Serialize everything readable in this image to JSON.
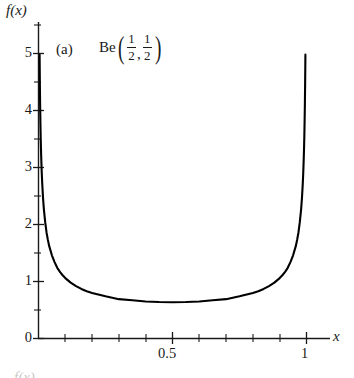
{
  "figure": {
    "panel_label": "(a)",
    "distribution_name": "Be",
    "param1_num": "1",
    "param1_den": "2",
    "param2_num": "1",
    "param2_den": "2",
    "comma": ",",
    "paren_open": "(",
    "paren_close": ")",
    "y_axis_label": "f(x)",
    "x_axis_label": "x",
    "footer_partial": "f(x)"
  },
  "chart_data": {
    "type": "line",
    "xlabel": "x",
    "ylabel": "f(x)",
    "xlim": [
      0,
      1.12
    ],
    "ylim": [
      0,
      5.4
    ],
    "grid": false,
    "legend": null,
    "annotations": [
      {
        "text": "(a)",
        "x": 0.065,
        "y": 5.2
      },
      {
        "text": "Be(1/2, 1/2)",
        "x": 0.28,
        "y": 5.25
      }
    ],
    "x_ticks_major": [
      0.5,
      1
    ],
    "x_tick_labels": [
      "0.5",
      "1"
    ],
    "x_ticks_minor": [
      0.1,
      0.2,
      0.3,
      0.4,
      0.6,
      0.7,
      0.8,
      0.9,
      1.1
    ],
    "y_ticks_major": [
      0,
      1,
      2,
      3,
      4,
      5
    ],
    "y_tick_labels": [
      "0",
      "1",
      "2",
      "3",
      "4",
      "5"
    ],
    "y_ticks_minor": [
      0.5,
      1.5,
      2.5,
      3.5,
      4.5
    ],
    "series": [
      {
        "name": "Be(1/2, 1/2) density",
        "formula": "f(x) = 1 / (pi * sqrt(x * (1 - x)))",
        "color": "#000000",
        "x": [
          0.0041,
          0.0045,
          0.005,
          0.006,
          0.007,
          0.008,
          0.009,
          0.01,
          0.012,
          0.014,
          0.017,
          0.02,
          0.025,
          0.03,
          0.035,
          0.04,
          0.05,
          0.06,
          0.07,
          0.08,
          0.09,
          0.1,
          0.12,
          0.14,
          0.16,
          0.18,
          0.2,
          0.25,
          0.3,
          0.35,
          0.4,
          0.45,
          0.5,
          0.55,
          0.6,
          0.65,
          0.7,
          0.75,
          0.8,
          0.82,
          0.84,
          0.86,
          0.88,
          0.9,
          0.91,
          0.92,
          0.93,
          0.94,
          0.95,
          0.96,
          0.965,
          0.97,
          0.975,
          0.98,
          0.983,
          0.986,
          0.988,
          0.99,
          0.991,
          0.992,
          0.993,
          0.994,
          0.995,
          0.9955,
          0.9959
        ],
        "y": [
          4.98,
          4.76,
          4.51,
          4.12,
          3.82,
          3.57,
          3.37,
          3.2,
          2.92,
          2.71,
          2.46,
          2.27,
          2.04,
          1.86,
          1.73,
          1.62,
          1.46,
          1.34,
          1.24,
          1.17,
          1.11,
          1.06,
          0.98,
          0.92,
          0.87,
          0.83,
          0.8,
          0.74,
          0.69,
          0.67,
          0.65,
          0.64,
          0.637,
          0.64,
          0.65,
          0.67,
          0.69,
          0.74,
          0.8,
          0.83,
          0.87,
          0.92,
          0.98,
          1.06,
          1.11,
          1.17,
          1.24,
          1.34,
          1.46,
          1.62,
          1.73,
          1.86,
          2.04,
          2.27,
          2.46,
          2.71,
          2.92,
          3.2,
          3.37,
          3.57,
          3.82,
          4.12,
          4.51,
          4.76,
          4.98
        ]
      }
    ]
  }
}
